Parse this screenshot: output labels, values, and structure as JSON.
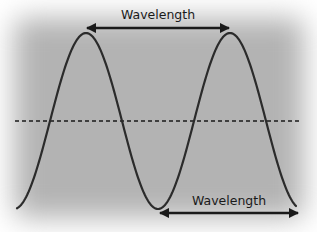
{
  "diagram": {
    "labels": {
      "top": "Wavelength",
      "bottom": "Wavelength"
    },
    "wave": {
      "midline_y": 121,
      "amplitude_px": 88,
      "wavelength_px": 144,
      "peak_x": [
        86,
        230
      ],
      "trough_x": [
        158
      ],
      "start_x": 17,
      "end_x": 296
    },
    "arrows": {
      "top": {
        "from": "peak 1",
        "to": "peak 2"
      },
      "bottom": {
        "from": "trough",
        "to": "right edge"
      }
    },
    "colors": {
      "background_gray": "#b3b3b3",
      "stroke": "#1a1a1a",
      "curve": "#2b2b2b"
    }
  }
}
